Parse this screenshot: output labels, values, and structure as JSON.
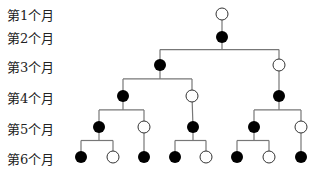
{
  "row_labels": [
    "第1个月",
    "第2个月",
    "第3个月",
    "第4个月",
    "第5个月",
    "第6个月"
  ],
  "row_y": [
    14,
    37,
    65,
    96,
    127,
    157
  ],
  "legend": {
    "filled": "mature pair",
    "open": "young pair"
  },
  "colors": {
    "line": "#777777",
    "filled": "#000000",
    "open_stroke": "#333333",
    "open_fill": "#ffffff"
  },
  "nodes": [
    {
      "id": "n1",
      "row": 1,
      "x": 222,
      "type": "open"
    },
    {
      "id": "n2",
      "row": 2,
      "x": 222,
      "type": "filled",
      "parent": "n1"
    },
    {
      "id": "n3a",
      "row": 3,
      "x": 160,
      "type": "filled",
      "parent": "n2"
    },
    {
      "id": "n3b",
      "row": 3,
      "x": 279,
      "type": "open",
      "parent": "n2"
    },
    {
      "id": "n4a",
      "row": 4,
      "x": 123,
      "type": "filled",
      "parent": "n3a"
    },
    {
      "id": "n4b",
      "row": 4,
      "x": 192,
      "type": "open",
      "parent": "n3a"
    },
    {
      "id": "n4c",
      "row": 4,
      "x": 279,
      "type": "filled",
      "parent": "n3b"
    },
    {
      "id": "n5a",
      "row": 5,
      "x": 99,
      "type": "filled",
      "parent": "n4a"
    },
    {
      "id": "n5b",
      "row": 5,
      "x": 144,
      "type": "open",
      "parent": "n4a"
    },
    {
      "id": "n5c",
      "row": 5,
      "x": 193,
      "type": "filled",
      "parent": "n4b"
    },
    {
      "id": "n5d",
      "row": 5,
      "x": 254,
      "type": "filled",
      "parent": "n4c"
    },
    {
      "id": "n5e",
      "row": 5,
      "x": 301,
      "type": "open",
      "parent": "n4c"
    },
    {
      "id": "n6a",
      "row": 6,
      "x": 81,
      "type": "filled",
      "parent": "n5a"
    },
    {
      "id": "n6b",
      "row": 6,
      "x": 113,
      "type": "open",
      "parent": "n5a"
    },
    {
      "id": "n6c",
      "row": 6,
      "x": 144,
      "type": "filled",
      "parent": "n5b"
    },
    {
      "id": "n6d",
      "row": 6,
      "x": 175,
      "type": "filled",
      "parent": "n5c"
    },
    {
      "id": "n6e",
      "row": 6,
      "x": 206,
      "type": "open",
      "parent": "n5c"
    },
    {
      "id": "n6f",
      "row": 6,
      "x": 237,
      "type": "filled",
      "parent": "n5d"
    },
    {
      "id": "n6g",
      "row": 6,
      "x": 269,
      "type": "open",
      "parent": "n5d"
    },
    {
      "id": "n6h",
      "row": 6,
      "x": 301,
      "type": "filled",
      "parent": "n5e"
    }
  ]
}
